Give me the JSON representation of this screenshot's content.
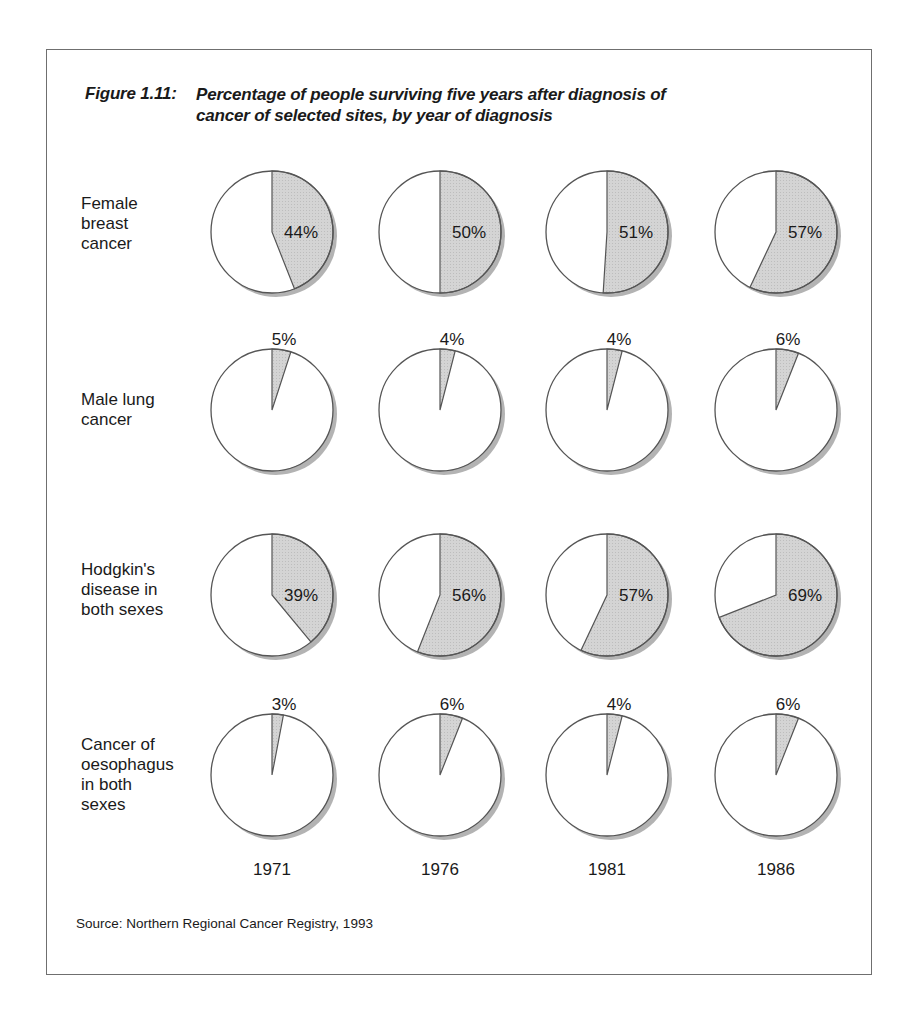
{
  "figure": {
    "label": "Figure 1.11:",
    "title_line1": "Percentage of people surviving five years after diagnosis of",
    "title_line2": "cancer of selected sites, by year of diagnosis",
    "source": "Source: Northern Regional Cancer Registry, 1993"
  },
  "rows": [
    {
      "label_lines": [
        "Female",
        "breast",
        "cancer"
      ]
    },
    {
      "label_lines": [
        "Male lung",
        "cancer"
      ]
    },
    {
      "label_lines": [
        "Hodgkin's",
        "disease in",
        "both sexes"
      ]
    },
    {
      "label_lines": [
        "Cancer of",
        "oesophagus",
        "in both",
        "sexes"
      ]
    }
  ],
  "years": [
    "1971",
    "1976",
    "1981",
    "1986"
  ],
  "colors": {
    "slice": "#d2d2d2",
    "rest": "#ffffff",
    "outline": "#555555",
    "shadow": "#9a9a9a"
  },
  "chart_data": {
    "type": "pie",
    "title": "Percentage of people surviving five years after diagnosis of cancer of selected sites, by year of diagnosis",
    "categories": [
      "1971",
      "1976",
      "1981",
      "1986"
    ],
    "series": [
      {
        "name": "Female breast cancer",
        "values": [
          44,
          50,
          51,
          57
        ]
      },
      {
        "name": "Male lung cancer",
        "values": [
          5,
          4,
          4,
          6
        ]
      },
      {
        "name": "Hodgkin's disease in both sexes",
        "values": [
          39,
          56,
          57,
          69
        ]
      },
      {
        "name": "Cancer of oesophagus in both sexes",
        "values": [
          3,
          6,
          4,
          6
        ]
      }
    ],
    "unit": "%",
    "source": "Northern Regional Cancer Registry, 1993"
  }
}
